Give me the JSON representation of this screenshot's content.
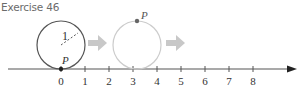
{
  "title": "Exercise 46",
  "diagram": {
    "axis": {
      "ticks": [
        "0",
        "1",
        "2",
        "3",
        "4",
        "5",
        "6",
        "7",
        "8"
      ],
      "color": "#555555"
    },
    "circle_start": {
      "radius_label": "1",
      "point_label": "P",
      "color": "#555555"
    },
    "circle_end": {
      "point_label": "P",
      "color": "#cccccc"
    },
    "arrow_color": "#c8c8c8",
    "point_color": "#555555"
  }
}
